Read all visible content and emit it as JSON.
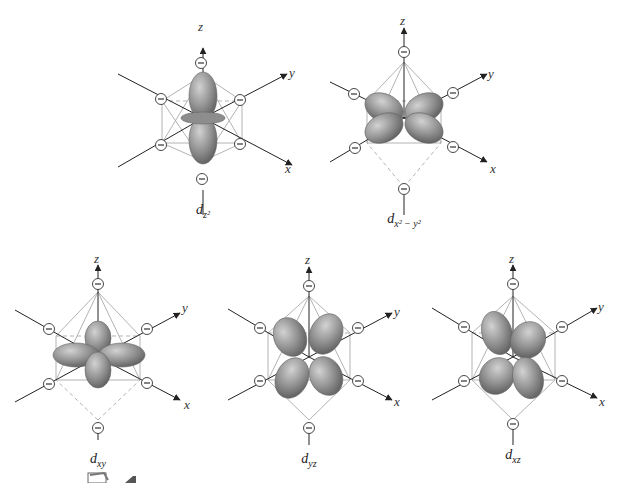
{
  "figure": {
    "colors": {
      "lobe": "#8f8f8f",
      "lobe_highlight": "#c9c9c9",
      "lobe_shadow": "#5e5e5e",
      "axis": "#222222",
      "octahedron_edge": "#a8a8a8",
      "charge_outline": "#333333",
      "background": "#ffffff"
    },
    "axis_labels": {
      "x": "x",
      "y": "y",
      "z": "z"
    },
    "charge_symbol": "⊖",
    "panels": [
      {
        "id": "dz2",
        "label_main": "d",
        "label_sub": "z²",
        "cx": 203,
        "cy": 118
      },
      {
        "id": "dx2y2",
        "label_main": "d",
        "label_sub": "x² − y²",
        "cx": 404,
        "cy": 118
      },
      {
        "id": "dxy",
        "label_main": "d",
        "label_sub": "xy",
        "cx": 98,
        "cy": 357
      },
      {
        "id": "dyz",
        "label_main": "d",
        "label_sub": "yz",
        "cx": 309,
        "cy": 357
      },
      {
        "id": "dxz",
        "label_main": "d",
        "label_sub": "xz",
        "cx": 513,
        "cy": 357
      }
    ]
  }
}
